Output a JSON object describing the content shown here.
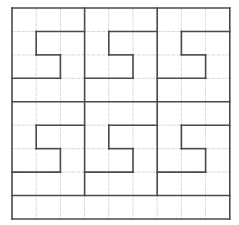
{
  "diagram": {
    "type": "grid-puzzle",
    "grid": {
      "origin_x": 12,
      "origin_y": 8,
      "cols": 9,
      "rows": 9,
      "cell_w": 24.2,
      "cell_h": 23.44,
      "grid_line_color": "#d9d9d9",
      "bold_line_color": "#4a4a4a",
      "background": "#ffffff"
    },
    "bold_segments": [
      [
        0,
        0,
        9,
        0
      ],
      [
        0,
        9,
        9,
        9
      ],
      [
        0,
        0,
        0,
        9
      ],
      [
        9,
        0,
        9,
        9
      ],
      [
        3,
        0,
        3,
        8
      ],
      [
        6,
        0,
        6,
        8
      ],
      [
        0,
        4,
        9,
        4
      ],
      [
        0,
        8,
        9,
        8
      ],
      [
        1,
        1,
        3,
        1
      ],
      [
        1,
        1,
        1,
        2
      ],
      [
        1,
        2,
        2,
        2
      ],
      [
        2,
        2,
        2,
        3
      ],
      [
        0,
        3,
        2,
        3
      ],
      [
        4,
        1,
        6,
        1
      ],
      [
        4,
        1,
        4,
        2
      ],
      [
        4,
        2,
        5,
        2
      ],
      [
        5,
        2,
        5,
        3
      ],
      [
        3,
        3,
        5,
        3
      ],
      [
        7,
        1,
        9,
        1
      ],
      [
        7,
        1,
        7,
        2
      ],
      [
        7,
        2,
        8,
        2
      ],
      [
        8,
        2,
        8,
        3
      ],
      [
        6,
        3,
        8,
        3
      ],
      [
        1,
        5,
        3,
        5
      ],
      [
        1,
        5,
        1,
        6
      ],
      [
        1,
        6,
        2,
        6
      ],
      [
        2,
        6,
        2,
        7
      ],
      [
        0,
        7,
        2,
        7
      ],
      [
        4,
        5,
        6,
        5
      ],
      [
        4,
        5,
        4,
        6
      ],
      [
        4,
        6,
        5,
        6
      ],
      [
        5,
        6,
        5,
        7
      ],
      [
        3,
        7,
        5,
        7
      ],
      [
        7,
        5,
        9,
        5
      ],
      [
        7,
        5,
        7,
        6
      ],
      [
        7,
        6,
        8,
        6
      ],
      [
        8,
        6,
        8,
        7
      ],
      [
        6,
        7,
        8,
        7
      ]
    ]
  }
}
